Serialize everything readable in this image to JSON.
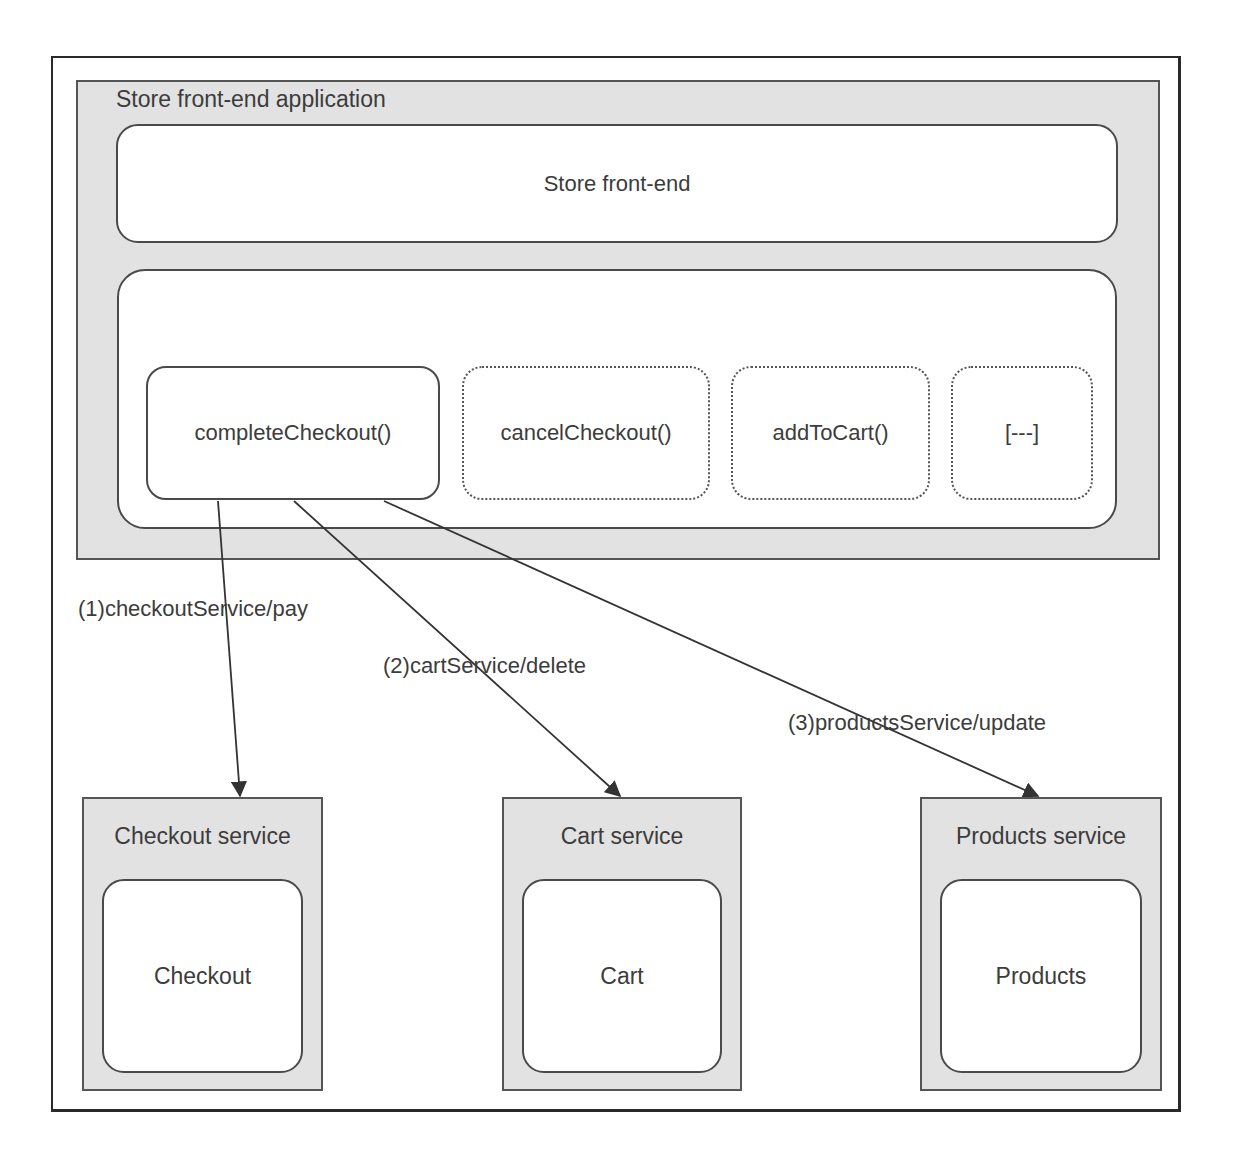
{
  "diagram": {
    "app": {
      "title": "Store front-end application",
      "storefront_label": "Store front-end",
      "functions": [
        {
          "label": "completeCheckout()",
          "style": "solid"
        },
        {
          "label": "cancelCheckout()",
          "style": "dashed"
        },
        {
          "label": "addToCart()",
          "style": "dashed"
        },
        {
          "label": "[---]",
          "style": "dashed"
        }
      ]
    },
    "calls": [
      {
        "label": "(1)checkoutService/pay",
        "from": "completeCheckout()",
        "to": "Checkout service"
      },
      {
        "label": "(2)cartService/delete",
        "from": "completeCheckout()",
        "to": "Cart service"
      },
      {
        "label": "(3)productsService/update",
        "from": "completeCheckout()",
        "to": "Products service"
      }
    ],
    "services": [
      {
        "title": "Checkout service",
        "component": "Checkout"
      },
      {
        "title": "Cart service",
        "component": "Cart"
      },
      {
        "title": "Products service",
        "component": "Products"
      }
    ],
    "colors": {
      "container_fill": "#e2e2e2",
      "box_fill": "#ffffff",
      "stroke": "#4a4a4a",
      "text": "#3c3c3c"
    }
  }
}
